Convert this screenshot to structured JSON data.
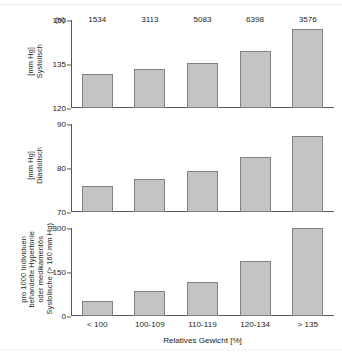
{
  "chart_data": {
    "type": "bar",
    "title": "",
    "xlabel": "Relatives Gewicht [%]",
    "categories": [
      "< 100",
      "100-109",
      "110-119",
      "120-134",
      "> 135"
    ],
    "sample_sizes_label": "(n)",
    "sample_sizes": [
      "1534",
      "3113",
      "5083",
      "6398",
      "3576"
    ],
    "grid": false,
    "legend": "none",
    "panels": [
      {
        "ylabel_lines": [
          "Systolisch",
          "[mm Hg]"
        ],
        "ylim": [
          120,
          150
        ],
        "yticks": [
          "120",
          "135",
          "150"
        ],
        "ytick_values": [
          120,
          135,
          150
        ],
        "values": [
          131.5,
          133.2,
          135.2,
          139.5,
          147.0
        ]
      },
      {
        "ylabel_lines": [
          "Diastolisch",
          "[mm Hg]"
        ],
        "ylim": [
          70,
          90
        ],
        "yticks": [
          "70",
          "80",
          "90"
        ],
        "ytick_values": [
          70,
          80,
          90
        ],
        "values": [
          76.0,
          77.4,
          79.3,
          82.5,
          87.3
        ]
      },
      {
        "ylabel_lines": [
          "Systolische (> 160 mm Hg)",
          "oder medikamentös",
          "behandelte Hypertonie",
          "pro 1000 Individuen"
        ],
        "ylim": [
          0,
          300
        ],
        "yticks": [
          "0",
          "150",
          "300"
        ],
        "ytick_values": [
          0,
          150,
          300
        ],
        "values": [
          50,
          85,
          115,
          188,
          300
        ]
      }
    ]
  },
  "style": {
    "bar_fill": "#c4c4c4",
    "bar_stroke": "#808184",
    "axis_color": "#58595b",
    "text_color": "#231f20",
    "background": "#ffffff"
  }
}
